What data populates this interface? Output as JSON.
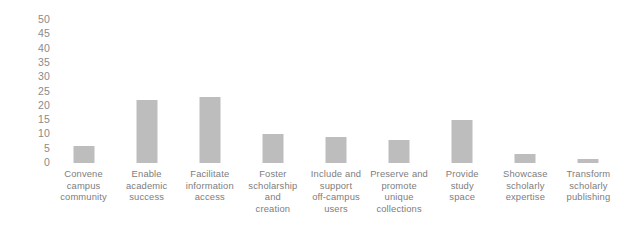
{
  "chart_data": {
    "type": "bar",
    "title": "",
    "subtitle": "",
    "xlabel": "",
    "ylabel": "",
    "ylim": [
      0,
      50
    ],
    "yticks": [
      0,
      5,
      10,
      15,
      20,
      25,
      30,
      35,
      40,
      45,
      50
    ],
    "ytick_labels": [
      "0",
      "5",
      "10",
      "15",
      "20",
      "25",
      "30",
      "35",
      "40",
      "45",
      "50"
    ],
    "grid": false,
    "legend": false,
    "legend_position": "none",
    "bar_color": "#bdbdbd",
    "tick_label_color": "#8a8a8a",
    "category_label_color": "#7d7d7d",
    "background_color": "#ffffff",
    "categories": [
      "Convene campus community",
      "Enable academic success",
      "Facilitate information access",
      "Foster scholarship and creation",
      "Include and support off-campus users",
      "Preserve and promote unique collections",
      "Provide study space",
      "Showcase scholarly expertise",
      "Transform scholarly publishing"
    ],
    "category_lines": [
      [
        "Convene",
        "campus",
        "community"
      ],
      [
        "Enable",
        "academic",
        "success"
      ],
      [
        "Facilitate",
        "information",
        "access"
      ],
      [
        "Foster",
        "scholarship",
        "and",
        "creation"
      ],
      [
        "Include and",
        "support",
        "off-campus",
        "users"
      ],
      [
        "Preserve and",
        "promote",
        "unique",
        "collections"
      ],
      [
        "Provide",
        "study",
        "space"
      ],
      [
        "Showcase",
        "scholarly",
        "expertise"
      ],
      [
        "Transform",
        "scholarly",
        "publishing"
      ]
    ],
    "values": [
      6,
      22,
      23,
      10,
      9,
      8,
      15,
      3,
      1.5
    ]
  }
}
